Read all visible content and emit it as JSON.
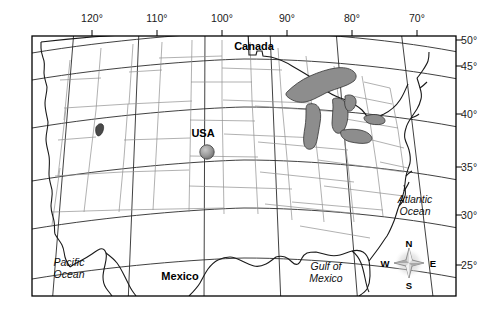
{
  "figure": {
    "type": "map",
    "region": "Contiguous United States and surrounding countries",
    "projection": "conic",
    "frame": {
      "left": 32,
      "top": 36,
      "right": 456,
      "bottom": 296
    }
  },
  "graticule": {
    "longitude_ticks": [
      {
        "label": "120°",
        "value": -120,
        "x": 92
      },
      {
        "label": "110°",
        "value": -110,
        "x": 157
      },
      {
        "label": "100°",
        "value": -100,
        "x": 222
      },
      {
        "label": "90°",
        "value": -90,
        "x": 287
      },
      {
        "label": "80°",
        "value": -80,
        "x": 352
      },
      {
        "label": "70°",
        "value": -70,
        "x": 417
      }
    ],
    "latitude_ticks": [
      {
        "label": "50°",
        "value": 50,
        "y": 40
      },
      {
        "label": "45°",
        "value": 45,
        "y": 66
      },
      {
        "label": "40°",
        "value": 40,
        "y": 114
      },
      {
        "label": "35°",
        "value": 35,
        "y": 167
      },
      {
        "label": "30°",
        "value": 30,
        "y": 215
      },
      {
        "label": "25°",
        "value": 25,
        "y": 265
      }
    ]
  },
  "labels": {
    "canada": "Canada",
    "usa": "USA",
    "mexico": "Mexico",
    "pacific_ocean_line1": "Pacific",
    "pacific_ocean_line2": "Ocean",
    "atlantic_ocean_line1": "Atlantic",
    "atlantic_ocean_line2": "Ocean",
    "gulf_line1": "Gulf of",
    "gulf_line2": "Mexico"
  },
  "compass": {
    "north": "N",
    "south": "S",
    "east": "E",
    "west": "W",
    "center_x": 409,
    "center_y": 263
  },
  "marker": {
    "name": "location-marker",
    "x": 207,
    "y": 152,
    "radius": 7,
    "approx_longitude": -98,
    "approx_latitude": 38
  },
  "colors": {
    "lake_fill": "#8d8d8d",
    "lake_stroke": "#333333",
    "coastline": "#1a1a1a",
    "state_border": "#8c8c8c",
    "graticule": "#2b2b2b",
    "frame": "#000000",
    "background": "#ffffff",
    "marker_fill": "#9a9a9a",
    "marker_stroke": "#4a4a4a"
  }
}
